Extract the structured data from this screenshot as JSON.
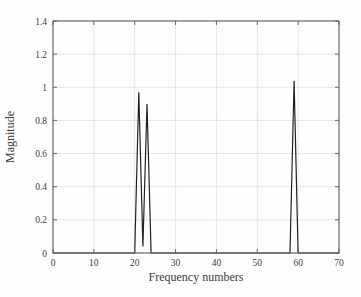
{
  "figure": {
    "kind": "magnitude-spectrum-plot"
  },
  "chart_data": {
    "type": "line",
    "title": "",
    "xlabel": "Frequency numbers",
    "ylabel": "Magnitude",
    "xlim": [
      0,
      70
    ],
    "ylim": [
      0,
      1.4
    ],
    "x_ticks": [
      0,
      10,
      20,
      30,
      40,
      50,
      60,
      70
    ],
    "x_tick_labels": [
      "0",
      "10",
      "20",
      "30",
      "40",
      "50",
      "60",
      "70"
    ],
    "y_ticks": [
      0,
      0.2,
      0.4,
      0.6,
      0.8,
      1,
      1.2,
      1.4
    ],
    "y_tick_labels": [
      "0",
      "0.2",
      "0.4",
      "0.6",
      "0.8",
      "1",
      "1.2",
      "1.4"
    ],
    "grid": true,
    "legend": null,
    "peaks": [
      {
        "x": 21,
        "y": 0.97
      },
      {
        "x": 23,
        "y": 0.9
      },
      {
        "x": 59,
        "y": 1.04
      }
    ],
    "points": [
      [
        0,
        0
      ],
      [
        20,
        0
      ],
      [
        21,
        0.97
      ],
      [
        22,
        0.04
      ],
      [
        23,
        0.9
      ],
      [
        24,
        0
      ],
      [
        58,
        0
      ],
      [
        59,
        1.04
      ],
      [
        60,
        0
      ],
      [
        70,
        0
      ]
    ],
    "colors": {
      "line": "#222222",
      "axis": "#666666",
      "grid": "#e4e6e2",
      "background": "#fefefe",
      "text": "#3b3b3b"
    }
  }
}
